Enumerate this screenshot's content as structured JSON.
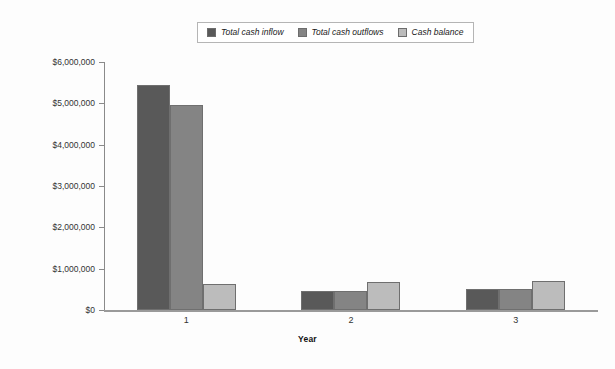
{
  "chart_data": {
    "type": "bar",
    "title": "",
    "subtitle": "",
    "xlabel": "Year",
    "ylabel": "",
    "categories": [
      "1",
      "2",
      "3"
    ],
    "series": [
      {
        "name": "Total cash inflow",
        "color": "#595959",
        "values": [
          5450000,
          470000,
          500000
        ]
      },
      {
        "name": "Total cash outflows",
        "color": "#848484",
        "values": [
          4950000,
          450000,
          510000
        ]
      },
      {
        "name": "Cash balance",
        "color": "#bcbcbc",
        "values": [
          630000,
          670000,
          700000
        ]
      }
    ],
    "ylim": [
      0,
      6000000
    ],
    "y_ticks": [
      0,
      1000000,
      2000000,
      3000000,
      4000000,
      5000000,
      6000000
    ],
    "y_tick_labels": [
      "$0",
      "$1,000,000",
      "$2,000,000",
      "$3,000,000",
      "$4,000,000",
      "$5,000,000",
      "$6,000,000"
    ],
    "grid": false,
    "legend_position": "top-center"
  },
  "legend": {
    "items": [
      {
        "label": "Total cash inflow",
        "color": "#595959"
      },
      {
        "label": "Total cash outflows",
        "color": "#848484"
      },
      {
        "label": "Cash balance",
        "color": "#bcbcbc"
      }
    ]
  },
  "axes": {
    "x_title": "Year",
    "x_tick_labels": [
      "1",
      "2",
      "3"
    ],
    "y_tick_labels": [
      "$6,000,000",
      "$5,000,000",
      "$4,000,000",
      "$3,000,000",
      "$2,000,000",
      "$1,000,000",
      "$0"
    ]
  }
}
